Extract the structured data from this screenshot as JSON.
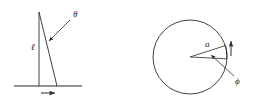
{
  "figure": {
    "background_color": "#ffffff",
    "stroke_color": "#2b2b2b",
    "label_color": "#1a1a1a",
    "panels": [
      {
        "id": "pendulum-panel",
        "name": "inverted-pendulum-on-cart",
        "labels": {
          "angle": "θ",
          "length": "ℓ"
        },
        "elements": [
          "vertical-reference-line",
          "rod-line",
          "ground-line",
          "angle-leader-arrow",
          "motion-arrow"
        ],
        "geometry": {
          "pivot_x": 39,
          "pivot_y": 12,
          "vertical_bottom_x": 39,
          "vertical_bottom_y": 86,
          "rod_bottom_x": 57,
          "rod_bottom_y": 86,
          "ground_y": 86,
          "ground_x1": 14,
          "ground_x2": 82,
          "motion_arrow_x1": 41,
          "motion_arrow_x2": 56,
          "motion_arrow_y": 93
        }
      },
      {
        "id": "circle-panel",
        "name": "rotating-disc-angle",
        "labels": {
          "radius": "a",
          "angle": "ϕ"
        },
        "elements": [
          "circle-outline",
          "radius-line-upper",
          "radius-line-lower",
          "angle-arc",
          "angle-leader-arrow",
          "rotation-arrow"
        ],
        "geometry": {
          "center_x": 190,
          "center_y": 57,
          "radius": 37,
          "radius_upper_end_x": 225,
          "radius_upper_end_y": 45,
          "radius_lower_end_x": 226,
          "radius_lower_end_y": 58,
          "rotation_arrow_x": 231,
          "rotation_arrow_y_top": 40,
          "rotation_arrow_y_bottom": 56
        }
      }
    ]
  }
}
